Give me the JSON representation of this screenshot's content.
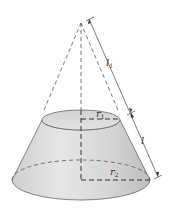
{
  "diagram": {
    "type": "frustum-of-cone",
    "labels": {
      "l1": {
        "base": "l",
        "sub": "1"
      },
      "r1": {
        "base": "r",
        "sub": "1"
      },
      "l": {
        "base": "l",
        "sub": ""
      },
      "r2": {
        "base": "r",
        "sub": "2"
      }
    },
    "colors": {
      "surface": "#d9d9d9",
      "surface_light": "#ececec",
      "stroke": "#555555",
      "dash": "#444444"
    }
  }
}
